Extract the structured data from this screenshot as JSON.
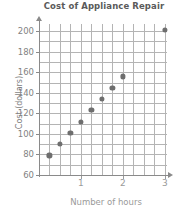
{
  "chart_data": {
    "type": "scatter",
    "title": "Cost of Appliance Repair",
    "xlabel": "Number of hours",
    "ylabel": "Cost (dollars)",
    "xlim": [
      0,
      3.05
    ],
    "ylim": [
      60,
      207
    ],
    "grid": true,
    "legend": "none",
    "x_ticks": [
      1,
      2,
      3
    ],
    "x_tick_labels": [
      "1",
      "2",
      "3"
    ],
    "x_minor_step": 0.25,
    "y_ticks": [
      60,
      80,
      100,
      120,
      140,
      160,
      180,
      200
    ],
    "y_tick_labels": [
      "60",
      "80",
      "100",
      "120",
      "140",
      "160",
      "180",
      "200"
    ],
    "y_minor_step": 10,
    "marker": "filled-circle",
    "marker_color": "#6e6e6e",
    "x": [
      0.25,
      0.5,
      0.75,
      1.0,
      1.25,
      1.5,
      1.75,
      2.0,
      3.0
    ],
    "y": [
      79,
      90,
      101,
      112,
      123,
      134,
      145,
      156,
      201
    ],
    "points": [
      {
        "x": 0.25,
        "y": 79
      },
      {
        "x": 0.5,
        "y": 90
      },
      {
        "x": 0.75,
        "y": 101
      },
      {
        "x": 1.0,
        "y": 112
      },
      {
        "x": 1.25,
        "y": 123
      },
      {
        "x": 1.5,
        "y": 134
      },
      {
        "x": 1.75,
        "y": 145
      },
      {
        "x": 2.0,
        "y": 156
      },
      {
        "x": 3.0,
        "y": 201
      }
    ]
  },
  "colors": {
    "title": "#5a5a5a",
    "axis": "#8a8a8a",
    "grid": "#b4b4b4",
    "tick_text": "#8f8f8f",
    "marker": "#6e6e6e",
    "background": "#ffffff"
  }
}
